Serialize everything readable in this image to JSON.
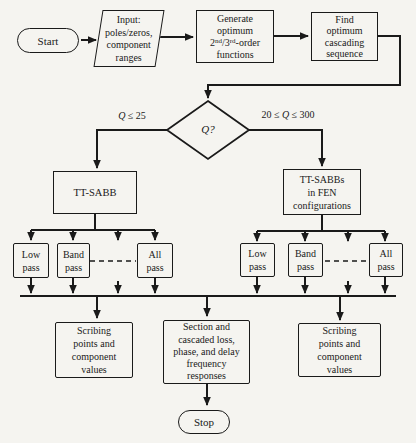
{
  "flowchart": {
    "start": "Start",
    "input": "Input:\npoles/zeros,\ncomponent\nranges",
    "generate": {
      "line1": "Generate",
      "line2": "optimum",
      "ord1_base": "2",
      "ord1_sup": "nd",
      "ord2_base": "/3",
      "ord2_sup": "rd",
      "ord_tail": "-order",
      "line4": "functions"
    },
    "find": "Find\noptimum\ncascading\nsequence",
    "decision": "Q?",
    "branch_left": {
      "pre": "",
      "q": "Q",
      "post": " ≤ 25"
    },
    "branch_right": {
      "pre": "20 ≤ ",
      "q": "Q",
      "post": " ≤ 300"
    },
    "ttsabb": "TT-SABB",
    "ttsabbs": "TT-SABBs\nin FEN\nconfigurations",
    "filters": {
      "low": "Low\npass",
      "band": "Band\npass",
      "all": "All\npass"
    },
    "scribing": "Scribing\npoints and\ncomponent\nvalues",
    "section": "Section and\ncascaded loss,\nphase, and delay\nfrequency\nresponses",
    "stop": "Stop"
  },
  "colors": {
    "ink": "#1a1a1a",
    "paper": "#f5f4f0"
  }
}
